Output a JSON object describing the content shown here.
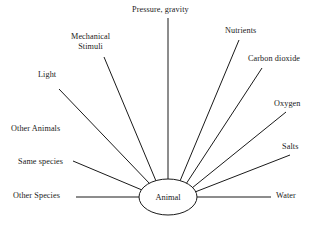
{
  "diagram": {
    "type": "radial-concept-map",
    "title_text": "",
    "center": {
      "label": "Animal",
      "shape": "ellipse",
      "cx": 168,
      "cy": 197,
      "rx": 29,
      "ry": 18,
      "stroke": "#1a1a1a",
      "fill": "#ffffff"
    },
    "line_color": "#1a1a1a",
    "line_width": 1,
    "background": "#ffffff",
    "text_color": "#1a1a1a",
    "nodes": [
      {
        "id": "pressure-gravity",
        "label": "Pressure, gravity",
        "label_x": 132,
        "label_y": 5,
        "multiline": false,
        "has_connector": true,
        "line": {
          "x1": 168,
          "y1": 18,
          "x2": 168,
          "y2": 180
        }
      },
      {
        "id": "mechanical-stimuli",
        "label": "Mechanical Stimuli",
        "label_line1": "Mechanical",
        "label_line2": "Stimuli",
        "label_x": 71,
        "label_y": 32,
        "multiline": true,
        "has_connector": true,
        "line": {
          "x1": 104,
          "y1": 57,
          "x2": 156,
          "y2": 181
        }
      },
      {
        "id": "light",
        "label": "Light",
        "label_x": 38,
        "label_y": 70,
        "multiline": false,
        "has_connector": true,
        "line": {
          "x1": 59,
          "y1": 89,
          "x2": 150,
          "y2": 184
        }
      },
      {
        "id": "other-animals",
        "label": "Other Animals",
        "label_x": 11,
        "label_y": 124,
        "multiline": false,
        "has_connector": false,
        "line": null
      },
      {
        "id": "same-species",
        "label": "Same species",
        "label_x": 18,
        "label_y": 157,
        "multiline": false,
        "has_connector": true,
        "line": {
          "x1": 73,
          "y1": 161,
          "x2": 142,
          "y2": 190
        }
      },
      {
        "id": "other-species",
        "label": "Other Species",
        "label_x": 13,
        "label_y": 191,
        "multiline": false,
        "has_connector": true,
        "line": {
          "x1": 76,
          "y1": 197,
          "x2": 139,
          "y2": 197
        }
      },
      {
        "id": "nutrients",
        "label": "Nutrients",
        "label_x": 225,
        "label_y": 26,
        "multiline": false,
        "has_connector": true,
        "line": {
          "x1": 239,
          "y1": 40,
          "x2": 180,
          "y2": 181
        }
      },
      {
        "id": "carbon-dioxide",
        "label": "Carbon dioxide",
        "label_x": 248,
        "label_y": 54,
        "multiline": false,
        "has_connector": true,
        "line": {
          "x1": 262,
          "y1": 68,
          "x2": 186,
          "y2": 184
        }
      },
      {
        "id": "oxygen",
        "label": "Oxygen",
        "label_x": 274,
        "label_y": 99,
        "multiline": false,
        "has_connector": true,
        "line": {
          "x1": 286,
          "y1": 112,
          "x2": 192,
          "y2": 188
        }
      },
      {
        "id": "salts",
        "label": "Salts",
        "label_x": 282,
        "label_y": 142,
        "multiline": false,
        "has_connector": true,
        "line": {
          "x1": 290,
          "y1": 155,
          "x2": 195,
          "y2": 192
        }
      },
      {
        "id": "water",
        "label": "Water",
        "label_x": 276,
        "label_y": 191,
        "multiline": false,
        "has_connector": true,
        "line": {
          "x1": 271,
          "y1": 197,
          "x2": 197,
          "y2": 197
        }
      }
    ]
  }
}
